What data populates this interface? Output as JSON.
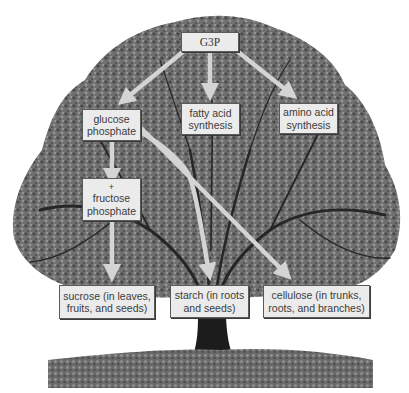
{
  "diagram": {
    "title": "",
    "nodes": {
      "g3p": {
        "lines": [
          "G3P"
        ]
      },
      "glucose_phosphate": {
        "lines": [
          "glucose",
          "phosphate"
        ]
      },
      "fatty_acid": {
        "lines": [
          "fatty acid",
          "synthesis"
        ]
      },
      "amino_acid": {
        "lines": [
          "amino acid",
          "synthesis"
        ]
      },
      "fructose_phosphate": {
        "lines": [
          "+",
          "fructose",
          "phosphate"
        ]
      },
      "sucrose": {
        "lines": [
          "sucrose (in leaves,",
          "fruits, and seeds)"
        ]
      },
      "starch": {
        "lines": [
          "starch (in roots",
          "and seeds)"
        ]
      },
      "cellulose": {
        "lines": [
          "cellulose (in trunks,",
          "roots, and branches)"
        ]
      }
    },
    "edges": [
      {
        "from": "G3P",
        "to": "glucose phosphate"
      },
      {
        "from": "G3P",
        "to": "fatty acid synthesis"
      },
      {
        "from": "G3P",
        "to": "amino acid synthesis"
      },
      {
        "from": "glucose phosphate",
        "to": "+ fructose phosphate"
      },
      {
        "from": "+ fructose phosphate",
        "to": "sucrose (in leaves, fruits, and seeds)"
      },
      {
        "from": "glucose phosphate",
        "to": "starch (in roots and seeds)"
      },
      {
        "from": "glucose phosphate",
        "to": "cellulose (in trunks, roots, and branches)"
      }
    ],
    "background": "tree-photo-grayscale",
    "colors": {
      "box_fill": "#ebebeb",
      "box_border": "#5a5a5a",
      "arrow": "#d4d4d4",
      "canopy": "#6e6e6e"
    }
  }
}
